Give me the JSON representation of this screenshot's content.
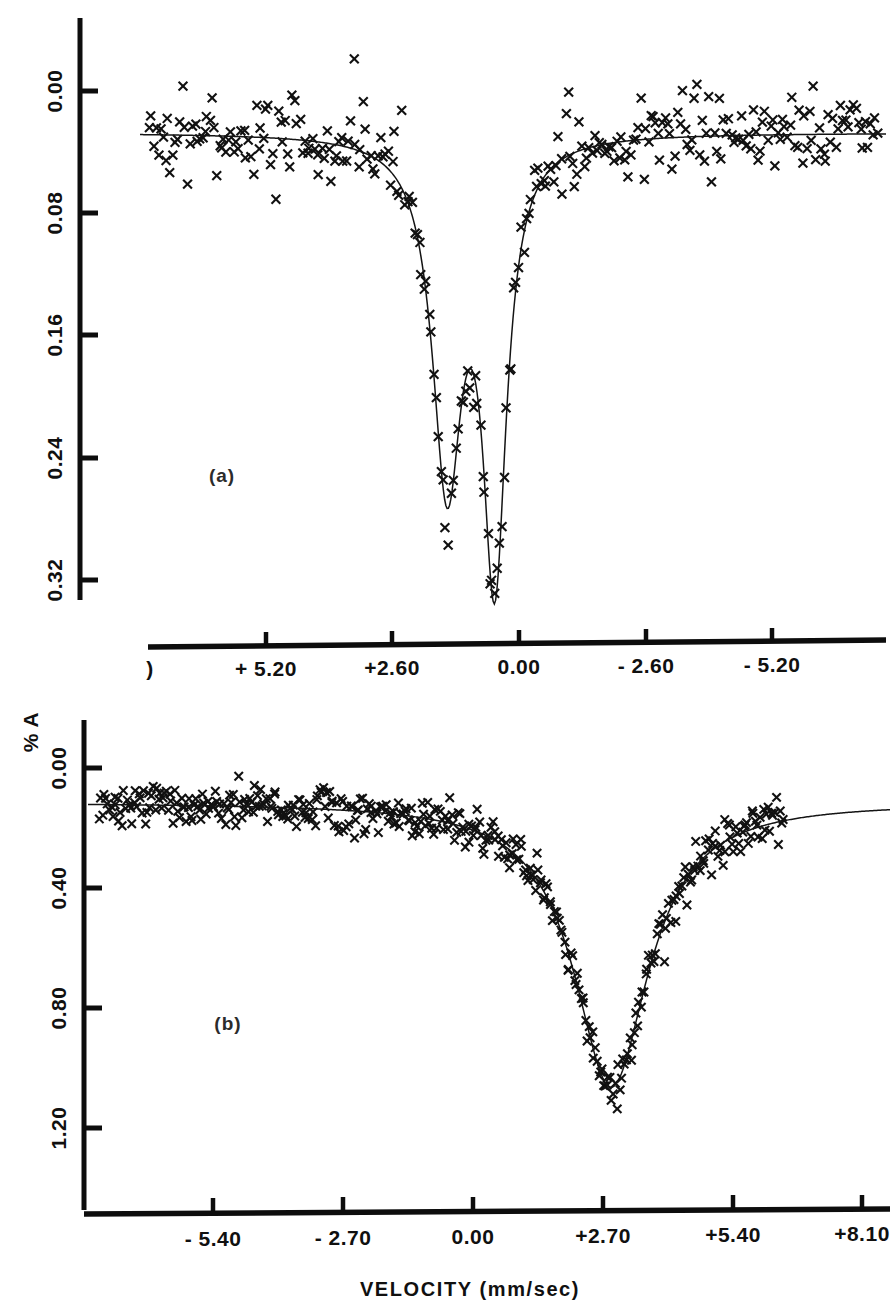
{
  "figure": {
    "axis_title": "VELOCITY  (mm/sec)",
    "y_axis_label": "% A",
    "marker_glyph": "x",
    "ink_color": "#111111"
  },
  "panel_a": {
    "tag": "(a)",
    "x_ticklabels": [
      "+ 5.20",
      "+2.60",
      "0.00",
      "- 2.60",
      "- 5.20"
    ],
    "y_ticklabels": [
      "0.00",
      "0.08",
      "0.16",
      "0.24",
      "0.32"
    ],
    "left_stub_label": ")"
  },
  "panel_b": {
    "tag": "(b)",
    "x_ticklabels": [
      "- 5.40",
      "- 2.70",
      "0.00",
      "+2.70",
      "+5.40",
      "+8.10"
    ],
    "y_ticklabels": [
      "0.00",
      "0.40",
      "0.80",
      "1.20"
    ]
  },
  "chart_data": [
    {
      "id": "panel-a",
      "type": "scatter",
      "title": "(a)",
      "subtitle": "",
      "xlabel": "VELOCITY  (mm/sec)",
      "ylabel": "% A",
      "xlim": [
        6.4,
        -6.6
      ],
      "ylim": [
        0.375,
        -0.035
      ],
      "x_inverted": true,
      "y_inverted": true,
      "grid": false,
      "legend": null,
      "x_ticks": [
        5.2,
        2.6,
        0.0,
        -2.6,
        -5.2
      ],
      "x_ticklabels": [
        "+ 5.20",
        "+2.60",
        "0.00",
        "- 2.60",
        "- 5.20"
      ],
      "y_ticks": [
        0.0,
        0.08,
        0.16,
        0.24,
        0.32
      ],
      "y_ticklabels": [
        "0.00",
        "0.08",
        "0.16",
        "0.24",
        "0.32"
      ],
      "noise_sigma": 0.017,
      "n_points": 300,
      "fit_model": "two-lorentzian-absorption",
      "peaks": [
        {
          "center": 1.05,
          "depth": 0.285,
          "fwhm": 0.62
        },
        {
          "center": 0.22,
          "depth": 0.36,
          "fwhm": 0.5
        }
      ],
      "baseline": 0.0,
      "description": "Moessbauer absorption spectrum with a quadrupole-split doublet; deeper line near 0.22 mm/sec, shallower line near 1.05 mm/sec."
    },
    {
      "id": "panel-b",
      "type": "scatter",
      "title": "(b)",
      "subtitle": "",
      "xlabel": "VELOCITY  (mm/sec)",
      "ylabel": "% A",
      "xlim": [
        -7.6,
        9.6
      ],
      "ylim": [
        1.52,
        -0.16
      ],
      "x_inverted": false,
      "y_inverted": true,
      "grid": false,
      "legend": null,
      "x_ticks": [
        -5.4,
        -2.7,
        0.0,
        2.7,
        5.4,
        8.1
      ],
      "x_ticklabels": [
        "- 5.40",
        "- 2.70",
        "0.00",
        "+2.70",
        "+5.40",
        "+8.10"
      ],
      "y_ticks": [
        0.0,
        0.4,
        0.8,
        1.2
      ],
      "y_ticklabels": [
        "0.00",
        "0.40",
        "0.80",
        "1.20"
      ],
      "noise_sigma": 0.055,
      "n_points": 420,
      "fit_model": "single-broad-lorentzian-absorption",
      "peaks": [
        {
          "center": 3.62,
          "depth": 1.33,
          "fwhm": 1.95
        }
      ],
      "baseline": 0.0,
      "description": "Moessbauer absorption spectrum showing one broad deep line centred near +3.6 mm/sec reaching about 1.33 % absorption."
    }
  ]
}
